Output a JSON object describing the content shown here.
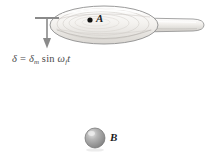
{
  "figure": {
    "background_color": "#ffffff",
    "width": 206,
    "height": 154
  },
  "annotations": {
    "equation": {
      "delta": "δ",
      "equals": "=",
      "delta_m": "δ",
      "subscript_m": "m",
      "sin": "sin",
      "omega": "ω",
      "subscript_f": "f",
      "t": "t",
      "full_text": "δ = δm sin ωf t",
      "color": "#4a4a4a"
    },
    "point_a_label": "A",
    "point_b_label": "B"
  },
  "objects": {
    "paddle": {
      "name": "wooden paddle",
      "fill_color": "#f2f0ed",
      "outline_color": "#8e8e8e",
      "grain_color": "#cfcbc6",
      "head_center_x": 104,
      "head_center_y": 25,
      "head_radius_x": 54,
      "head_radius_y": 19,
      "handle_end_x": 204
    },
    "arrow": {
      "name": "downward displacement arrow",
      "color": "#8a8a8a",
      "cap_y": 18,
      "tip_y": 48,
      "x": 47
    },
    "cord": {
      "name": "suspension cord",
      "color": "#a6a6a6",
      "x": 95,
      "top_y": 41,
      "bottom_y": 130
    },
    "ball": {
      "name": "pendulum bob",
      "center_x": 95,
      "center_y": 138,
      "radius": 10,
      "fill_color": "#a8a8a8",
      "highlight_color": "#d8d8d8",
      "outline_color": "#6f6f6f"
    },
    "point_a_dot": {
      "x": 90,
      "y": 20,
      "radius": 2.6,
      "color": "#111111"
    }
  }
}
